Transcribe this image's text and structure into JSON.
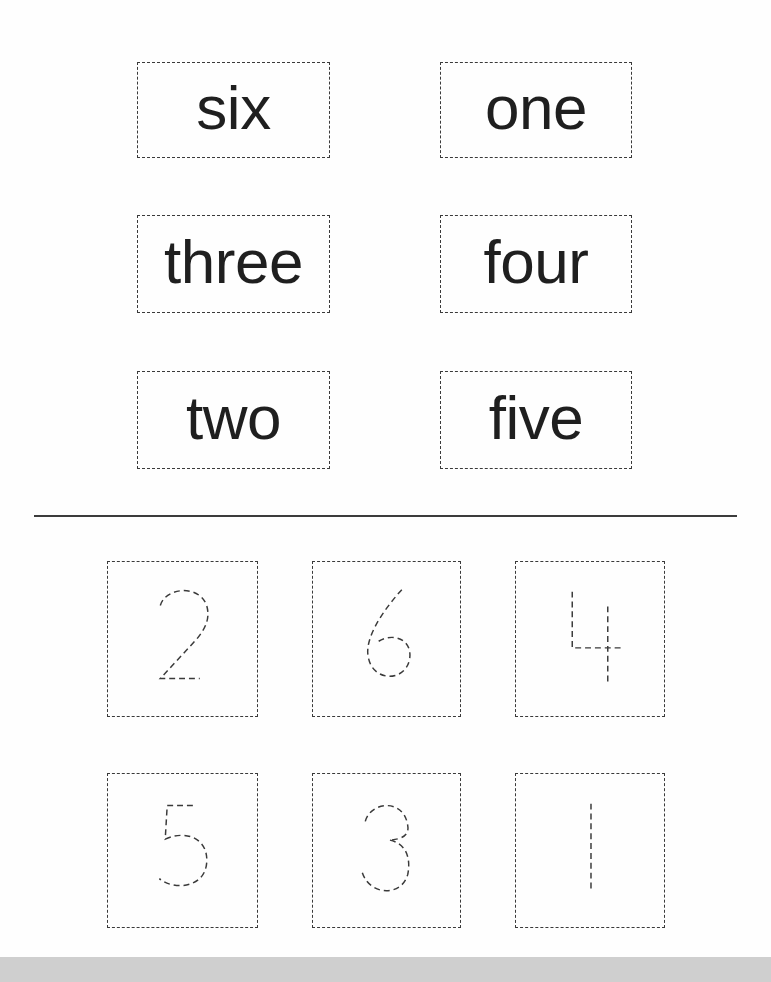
{
  "worksheet": {
    "word_cards": [
      {
        "label": "six"
      },
      {
        "label": "one"
      },
      {
        "label": "three"
      },
      {
        "label": "four"
      },
      {
        "label": "two"
      },
      {
        "label": "five"
      }
    ],
    "number_cards": [
      {
        "digit": "2",
        "style": "dashed-trace"
      },
      {
        "digit": "6",
        "style": "dashed-trace"
      },
      {
        "digit": "4",
        "style": "dashed-trace"
      },
      {
        "digit": "5",
        "style": "dashed-trace"
      },
      {
        "digit": "3",
        "style": "dashed-trace"
      },
      {
        "digit": "1",
        "style": "dashed-trace"
      }
    ]
  },
  "colors": {
    "ink": "#1f1f1f",
    "dash": "#3a3a3a",
    "bottom_bar": "#cfcfcf"
  }
}
